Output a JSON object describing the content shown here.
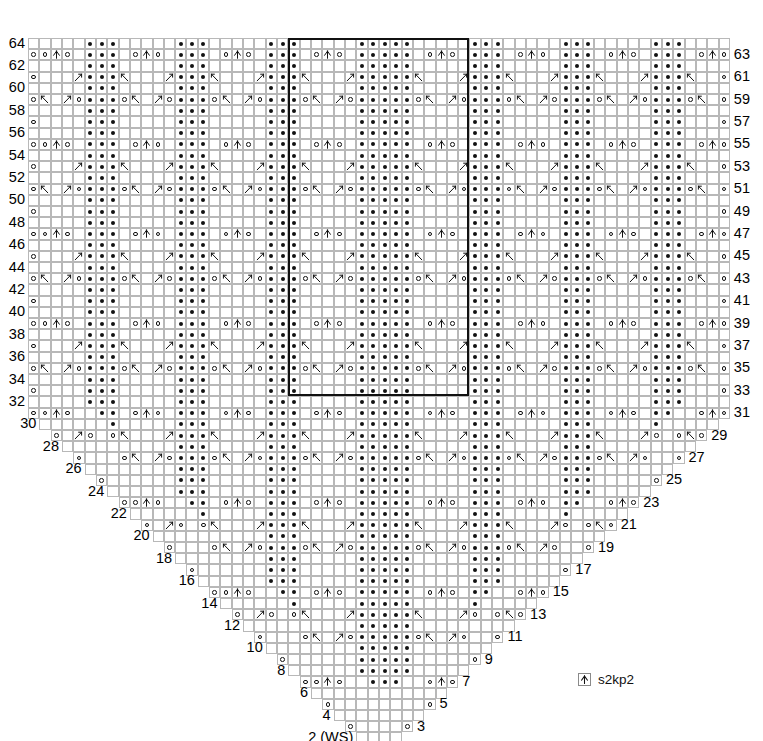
{
  "chart": {
    "type": "knitting-chart",
    "columns": 62,
    "rows": 64,
    "center_column": 31,
    "cell_w": 11.32,
    "cell_h": 11.2,
    "grid_left": 28,
    "grid_top": 38,
    "grid_color": "#b8b8b8",
    "repeat_box": {
      "col_start": 24,
      "col_end": 39,
      "row_start": 33,
      "row_end": 64,
      "color": "#111111"
    }
  },
  "legend": {
    "items": [
      {
        "symbol": "cdd",
        "label": "s2kp2",
        "name": "centered-double-decrease"
      }
    ]
  },
  "row_labels": {
    "bottom_left": "2 (WS)",
    "bottom_right": "1 (RS)",
    "left_even": [
      64,
      62,
      60,
      58,
      56,
      54,
      52,
      50,
      48,
      46,
      44,
      42,
      40,
      38,
      36,
      34,
      32,
      30,
      28,
      26,
      24,
      22,
      20,
      18,
      16,
      14,
      12,
      10,
      8,
      6,
      4
    ],
    "right_odd": [
      63,
      61,
      59,
      57,
      55,
      53,
      51,
      49,
      47,
      45,
      43,
      41,
      39,
      37,
      35,
      33,
      31,
      29,
      27,
      25,
      23,
      21,
      19,
      17,
      15,
      13,
      11,
      9,
      7,
      5,
      3
    ]
  },
  "symbols": {
    "dot": {
      "name": "purl-dot",
      "desc": "purl"
    },
    "yo": {
      "name": "yarn-over",
      "desc": "yo"
    },
    "cdd": {
      "name": "s2kp2",
      "desc": "centered double decrease"
    },
    "k2tog": {
      "name": "k2tog",
      "desc": "right-leaning decrease"
    },
    "ssk": {
      "name": "ssk",
      "desc": "left-leaning decrease"
    }
  },
  "chart_data": {
    "type": "heatmap",
    "xlabel": "stitches",
    "ylabel": "rows",
    "note": "Row r (1-indexed from bottom) spans columns 32-r .. 31+r of a 62-column grid. Symbols are coded per cell as absolute column index.",
    "rows": [
      {
        "row": 64,
        "dot": [
          5,
          6,
          7,
          13,
          14,
          15,
          21,
          22,
          23,
          29,
          30,
          31,
          32,
          33,
          40,
          41,
          42,
          48,
          49,
          50,
          56,
          57,
          58
        ],
        "yo": [],
        "cdd": [],
        "k2tog": [],
        "ssk": []
      },
      {
        "row": 63,
        "dot": [
          5,
          6,
          7,
          13,
          14,
          15,
          21,
          22,
          23,
          29,
          30,
          31,
          32,
          33,
          40,
          41,
          42,
          48,
          49,
          50,
          56,
          57,
          58
        ],
        "yo": [
          1,
          9,
          11,
          17,
          19,
          25,
          27,
          35,
          37,
          44,
          46,
          52,
          54,
          62
        ],
        "cdd": [
          10,
          18,
          26,
          36,
          45,
          53
        ],
        "k2tog": [],
        "ssk": []
      },
      {
        "row": 62,
        "dot": [
          5,
          6,
          7,
          13,
          14,
          15,
          21,
          22,
          23,
          29,
          30,
          31,
          32,
          33,
          40,
          41,
          42,
          48,
          49,
          50,
          56,
          57,
          58
        ],
        "yo": [],
        "cdd": [],
        "k2tog": [],
        "ssk": []
      },
      {
        "row": 61,
        "dot": [
          5,
          6,
          7,
          13,
          14,
          15,
          21,
          22,
          23,
          29,
          30,
          31,
          32,
          33,
          40,
          41,
          42,
          48,
          49,
          50,
          56,
          57,
          58
        ],
        "yo": [
          2,
          9,
          12,
          17,
          20,
          25,
          28,
          35,
          38,
          44,
          47,
          52,
          55,
          61
        ],
        "cdd": [
          10,
          18,
          26,
          36,
          45,
          53
        ],
        "k2tog": [
          18
        ],
        "ssk": []
      },
      {
        "row": 60,
        "dot": [
          5,
          6,
          7,
          13,
          14,
          15,
          21,
          22,
          23,
          29,
          30,
          31,
          32,
          33,
          40,
          41,
          42,
          48,
          49,
          50,
          56,
          57,
          58
        ],
        "yo": [],
        "cdd": [],
        "k2tog": [],
        "ssk": []
      },
      {
        "row": 59,
        "dot": [
          5,
          6,
          7,
          13,
          14,
          15,
          21,
          22,
          23,
          29,
          30,
          31,
          32,
          33,
          40,
          41,
          42,
          48,
          49,
          50,
          56,
          57,
          58
        ],
        "yo": [
          3,
          8,
          13,
          16,
          21,
          24,
          34,
          39,
          43,
          48,
          51,
          60
        ],
        "cdd": [
          10,
          26,
          36,
          53
        ],
        "k2tog": [],
        "ssk": []
      },
      {
        "row": 58,
        "dot": [],
        "yo": [],
        "cdd": [],
        "k2tog": [],
        "ssk": []
      },
      {
        "row": 1,
        "dot": [],
        "yo": [
          31,
          33
        ],
        "cdd": [],
        "k2tog": [],
        "ssk": [],
        "cells": 3
      }
    ],
    "pattern_description": "Symmetric triangular shawl; center spine at column 31-33; stitch count grows by 2 each RS row; purl-block motifs in vertical columns with yo/s2kp2 eyelet diamonds and paired k2tog/ssk traveling lines."
  }
}
